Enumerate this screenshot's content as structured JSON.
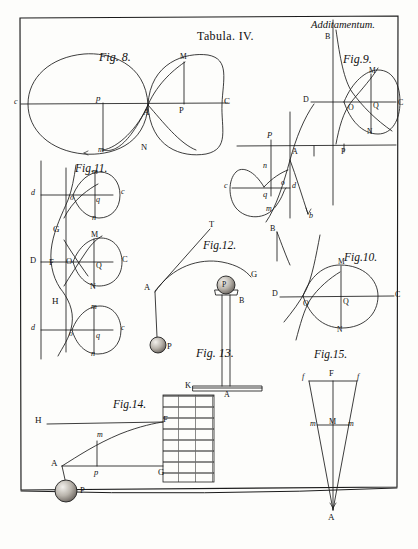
{
  "plate": {
    "title": "Tabula. IV.",
    "header_right": "Additamentum.",
    "paper_color": "#fdfdfb",
    "ink_color": "#1b1b1b"
  },
  "figures": {
    "fig8": {
      "caption": "Fig. 8.",
      "labels": [
        "c",
        "p",
        "A",
        "P",
        "C",
        "M",
        "N",
        "m"
      ]
    },
    "fig9": {
      "caption": "Fig.9.",
      "labels": [
        "B",
        "D",
        "O",
        "Q",
        "C",
        "M",
        "N",
        "P",
        "A",
        "P",
        "c",
        "q",
        "n",
        "m",
        "o",
        "d",
        "B",
        "b"
      ]
    },
    "fig10": {
      "caption": "Fig.10.",
      "labels": [
        "D",
        "O",
        "Q",
        "C",
        "M",
        "N"
      ]
    },
    "fig11": {
      "caption": "Fig.11.",
      "labels": [
        "d",
        "o",
        "q",
        "c",
        "m",
        "n",
        "G",
        "D",
        "F",
        "O",
        "Q",
        "C",
        "M",
        "N",
        "H",
        "d",
        "o",
        "q",
        "c",
        "m",
        "n"
      ]
    },
    "fig12": {
      "caption": "Fig.12.",
      "labels": [
        "T",
        "A",
        "G",
        "P"
      ]
    },
    "fig13": {
      "caption": "Fig. 13.",
      "labels": [
        "P",
        "B",
        "A"
      ]
    },
    "fig14": {
      "caption": "Fig.14.",
      "labels": [
        "K",
        "H",
        "F",
        "m",
        "A",
        "p",
        "G",
        "P"
      ]
    },
    "fig15": {
      "caption": "Fig.15.",
      "labels": [
        "f",
        "F",
        "f",
        "m",
        "M",
        "m",
        "A"
      ]
    }
  }
}
